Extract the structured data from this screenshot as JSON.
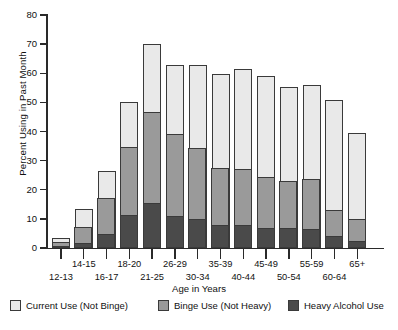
{
  "chart_data": {
    "type": "bar",
    "stacked": true,
    "title": "",
    "xlabel": "Age in Years",
    "ylabel": "Percent Using in Past Month",
    "ylim": [
      0,
      80
    ],
    "yticks": [
      0,
      10,
      20,
      30,
      40,
      50,
      60,
      70,
      80
    ],
    "grid": false,
    "legend_position": "bottom",
    "categories": [
      "12-13",
      "14-15",
      "16-17",
      "18-20",
      "21-25",
      "26-29",
      "30-34",
      "35-39",
      "40-44",
      "45-49",
      "50-54",
      "55-59",
      "60-64",
      "65+"
    ],
    "series": [
      {
        "name": "Heavy Alcohol Use",
        "color": "#4a4a4a",
        "values": [
          0.6,
          2.0,
          5.0,
          11.6,
          15.6,
          11.2,
          10.0,
          8.0,
          8.2,
          7.1,
          6.9,
          6.6,
          4.4,
          2.6
        ]
      },
      {
        "name": "Binge Use (Not Heavy)",
        "color": "#9a9a9a",
        "values": [
          1.6,
          5.3,
          12.4,
          23.2,
          31.1,
          28.1,
          24.5,
          19.6,
          19.0,
          17.5,
          16.1,
          17.1,
          8.7,
          7.6
        ]
      },
      {
        "name": "Current Use (Not Binge)",
        "color": "#e9e9e9",
        "values": [
          1.3,
          6.0,
          9.1,
          15.2,
          23.5,
          23.5,
          28.3,
          32.0,
          34.2,
          34.6,
          32.2,
          32.3,
          37.6,
          29.4
        ]
      }
    ],
    "totals": [
      3.5,
      13.3,
      26.5,
      50.0,
      70.2,
      62.8,
      62.8,
      59.6,
      61.4,
      59.2,
      55.2,
      56.0,
      50.7,
      39.6
    ],
    "stack_tops": {
      "heavy": [
        0.6,
        2.0,
        5.0,
        11.6,
        15.6,
        11.2,
        10.0,
        8.0,
        8.2,
        7.1,
        6.9,
        6.6,
        4.4,
        2.6
      ],
      "binge": [
        2.2,
        7.3,
        17.4,
        34.8,
        46.7,
        39.3,
        34.5,
        27.6,
        27.2,
        24.6,
        23.0,
        23.7,
        13.1,
        10.2
      ],
      "current": [
        3.5,
        13.3,
        26.5,
        50.0,
        70.2,
        62.8,
        62.8,
        59.6,
        61.4,
        59.2,
        55.2,
        56.0,
        50.7,
        39.6
      ]
    }
  },
  "axes": {
    "y_title": "Percent Using in Past Month",
    "x_title": "Age in Years",
    "y_tick_labels": [
      "0",
      "10",
      "20",
      "30",
      "40",
      "50",
      "60",
      "70",
      "80"
    ],
    "x_tick_labels": [
      "12-13",
      "14-15",
      "16-17",
      "18-20",
      "21-25",
      "26-29",
      "30-34",
      "35-39",
      "40-44",
      "45-49",
      "50-54",
      "55-59",
      "60-64",
      "65+"
    ]
  },
  "legend": {
    "items": [
      {
        "label": "Current Use (Not Binge)",
        "color": "#e9e9e9"
      },
      {
        "label": "Binge Use (Not Heavy)",
        "color": "#9a9a9a"
      },
      {
        "label": "Heavy Alcohol Use",
        "color": "#4a4a4a"
      }
    ]
  }
}
